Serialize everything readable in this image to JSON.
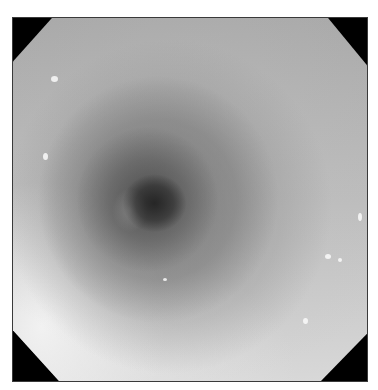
{
  "image": {
    "description": "Grayscale endoscopic view of a tubular lumen with concentric mucosal folds and a dark central opening",
    "colors": {
      "background": "#ffffff",
      "corner_mask": "#000000",
      "mucosa_light": "#d8d8d8",
      "mucosa_mid": "#a8a8a8",
      "lumen_dark": "#2a2a2a"
    },
    "frame": {
      "left": 13,
      "top": 18,
      "width": 354,
      "height": 363,
      "shape": "octagon"
    }
  }
}
